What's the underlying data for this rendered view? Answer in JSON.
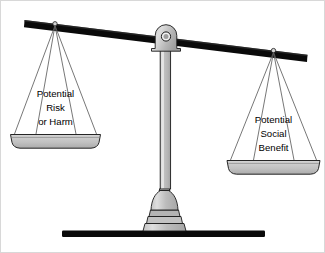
{
  "figure": {
    "name": "balance-scale-diagram",
    "background_color": "#ffffff",
    "border_color": "#d8d8d8",
    "beam_color": "#0a0a0a",
    "metal_fill": "#bdbdbd",
    "metal_light": "#dcdcdc",
    "metal_dark": "#9a9a9a",
    "outline_color": "#1a1a1a",
    "string_color": "#6e6e6e",
    "text_color": "#000000",
    "base_bar_color": "#0a0a0a"
  },
  "left_pan": {
    "name": "potential-risk-or-harm",
    "side": "left",
    "state": "lowered",
    "lines": [
      "Potential",
      "Risk",
      "or Harm"
    ]
  },
  "right_pan": {
    "name": "potential-social-benefit",
    "side": "right",
    "state": "raised",
    "lines": [
      "Potential",
      "Social",
      "Benefit"
    ]
  },
  "parts": {
    "beam_label": "balance-beam",
    "fulcrum_label": "fulcrum-pivot",
    "column_label": "support-column",
    "pedestal_label": "pedestal-base",
    "ground_label": "ground-bar"
  }
}
